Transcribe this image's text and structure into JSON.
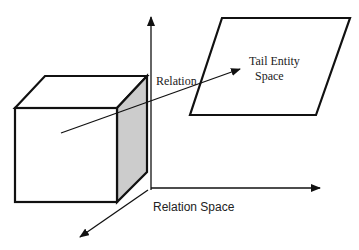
{
  "diagram": {
    "labels": {
      "relation": "Relation",
      "tail_entity_line1": "Tail Entity",
      "tail_entity_line2": "Space",
      "relation_space": "Relation Space"
    },
    "colors": {
      "stroke": "#111111",
      "shaded_face": "#cccccc",
      "background": "#ffffff"
    }
  }
}
